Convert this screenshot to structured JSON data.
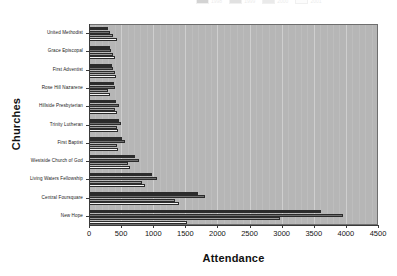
{
  "chart_data": {
    "type": "bar",
    "orientation": "horizontal",
    "title": "",
    "xlabel": "Attendance",
    "ylabel": "Churches",
    "xlim": [
      0,
      4500
    ],
    "xticks": [
      0,
      500,
      1000,
      1500,
      2000,
      2500,
      3000,
      3500,
      4000,
      4500
    ],
    "xtick_labels": [
      "0",
      "500",
      "1000",
      "1500",
      "2000",
      "2500",
      "3000",
      "3500",
      "4000",
      "4500"
    ],
    "grid": true,
    "grid_axis": "x",
    "legend_position": "top",
    "legend_clipped": true,
    "categories": [
      "United Methodist",
      "Grace Episcopal",
      "First Adventist",
      "Rose Hill Nazarene",
      "Hillside Presbyterian",
      "Trinity Lutheran",
      "First Baptist",
      "Westside Church of God",
      "Living Waters Fellowship",
      "Central Foursquare",
      "New Hope"
    ],
    "series": [
      {
        "name": "Series 1",
        "color": "#2b2b2b",
        "values": [
          300,
          330,
          360,
          390,
          420,
          470,
          520,
          720,
          980,
          1690,
          3610
        ]
      },
      {
        "name": "Series 2",
        "color": "#6f6f6f",
        "values": [
          330,
          350,
          380,
          410,
          460,
          500,
          560,
          780,
          1060,
          1810,
          3960
        ]
      },
      {
        "name": "Series 3",
        "color": "#9a9a9a",
        "values": [
          380,
          370,
          400,
          300,
          400,
          430,
          430,
          600,
          820,
          1340,
          2980
        ]
      },
      {
        "name": "Series 4",
        "color": "#f4f4f4",
        "values": [
          440,
          400,
          420,
          330,
          430,
          450,
          450,
          640,
          870,
          1400,
          1530
        ]
      }
    ]
  },
  "legend": {
    "entries": [
      {
        "label": "1998"
      },
      {
        "label": "1999"
      },
      {
        "label": "2000"
      },
      {
        "label": "2001"
      }
    ]
  }
}
